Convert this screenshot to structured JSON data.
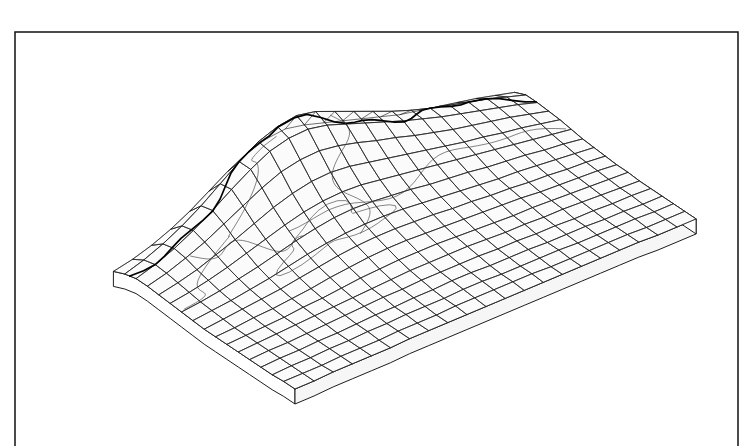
{
  "figure": {
    "kind": "wireframe-surface-block",
    "background_color": "#ffffff",
    "line_color": "#1a1a1a",
    "facet_fill_color": "#fbfbfb",
    "overlay_color": "#3a3a3a",
    "ridge_color": "#000000",
    "frame_color": "#111111"
  },
  "frame": {
    "name": "plot-border",
    "left": 15,
    "top": 32,
    "right": 738,
    "bottom": 446,
    "sides_drawn": "left, top, right",
    "stroke_width": 1.5
  },
  "chart_data": {
    "type": "surface",
    "subtitle": "",
    "xlabel": "",
    "ylabel": "",
    "zlabel": "",
    "grid": true,
    "legend": "none",
    "grid_columns": 22,
    "grid_rows": 17,
    "projection": {
      "kind": "oblique-parallel",
      "origin_x": 295,
      "origin_y": 395,
      "u_dx": 19.1,
      "u_dy": -8.05,
      "v_dx": -11.35,
      "v_dy": -6.6,
      "z_scale": -1.0
    },
    "base_slab": {
      "thickness_px": 15,
      "front_left_vertex": [
        45,
        288
      ],
      "bottom_vertex": [
        295,
        396
      ],
      "right_vertex": [
        716,
        219
      ],
      "back_vertex": [
        462,
        113
      ]
    },
    "elevation_range": [
      0,
      108
    ],
    "elevation_units": "relative",
    "peak": {
      "grid_col": 9,
      "grid_row": 1,
      "value": 108,
      "screen": [
        357,
        22
      ]
    },
    "elevation_grid": [
      [
        18,
        22,
        28,
        36,
        46,
        58,
        70,
        80,
        86,
        88,
        84,
        78,
        72,
        66,
        60,
        54,
        50,
        46,
        42,
        38,
        33,
        28
      ],
      [
        22,
        28,
        36,
        46,
        58,
        72,
        86,
        98,
        105,
        108,
        104,
        96,
        88,
        80,
        72,
        65,
        59,
        54,
        49,
        44,
        38,
        32
      ],
      [
        24,
        30,
        38,
        48,
        60,
        73,
        85,
        95,
        100,
        101,
        97,
        90,
        83,
        76,
        69,
        63,
        57,
        52,
        47,
        42,
        37,
        31
      ],
      [
        23,
        28,
        35,
        43,
        53,
        63,
        73,
        81,
        85,
        86,
        83,
        78,
        72,
        67,
        61,
        56,
        51,
        47,
        43,
        39,
        34,
        29
      ],
      [
        21,
        25,
        30,
        37,
        44,
        52,
        60,
        66,
        70,
        71,
        69,
        65,
        61,
        57,
        53,
        49,
        45,
        42,
        38,
        35,
        31,
        27
      ],
      [
        19,
        22,
        26,
        31,
        37,
        43,
        49,
        54,
        57,
        58,
        57,
        54,
        51,
        48,
        45,
        42,
        39,
        36,
        33,
        30,
        27,
        24
      ],
      [
        17,
        19,
        22,
        26,
        30,
        35,
        40,
        44,
        47,
        48,
        47,
        45,
        43,
        40,
        38,
        36,
        33,
        31,
        29,
        26,
        24,
        21
      ],
      [
        15,
        17,
        19,
        22,
        25,
        29,
        33,
        36,
        38,
        39,
        39,
        38,
        36,
        34,
        32,
        30,
        28,
        27,
        25,
        23,
        21,
        19
      ],
      [
        13,
        15,
        17,
        19,
        21,
        24,
        27,
        30,
        32,
        33,
        33,
        32,
        31,
        29,
        28,
        26,
        25,
        23,
        22,
        20,
        19,
        17
      ],
      [
        12,
        13,
        15,
        16,
        18,
        20,
        23,
        25,
        27,
        28,
        28,
        27,
        26,
        25,
        24,
        23,
        22,
        20,
        19,
        18,
        17,
        15
      ],
      [
        11,
        12,
        13,
        14,
        16,
        17,
        19,
        21,
        22,
        23,
        23,
        23,
        22,
        21,
        20,
        19,
        19,
        18,
        17,
        16,
        15,
        14
      ],
      [
        10,
        11,
        12,
        13,
        14,
        15,
        16,
        17,
        18,
        19,
        19,
        19,
        19,
        18,
        17,
        17,
        16,
        16,
        15,
        14,
        13,
        12
      ],
      [
        9,
        10,
        10,
        11,
        12,
        13,
        14,
        15,
        15,
        16,
        16,
        16,
        16,
        15,
        15,
        14,
        14,
        13,
        13,
        12,
        12,
        11
      ],
      [
        8,
        9,
        9,
        10,
        10,
        11,
        12,
        12,
        13,
        13,
        14,
        14,
        13,
        13,
        13,
        12,
        12,
        12,
        11,
        11,
        10,
        10
      ],
      [
        7,
        8,
        8,
        9,
        9,
        10,
        10,
        11,
        11,
        11,
        12,
        12,
        11,
        11,
        11,
        11,
        10,
        10,
        10,
        10,
        9,
        9
      ],
      [
        7,
        7,
        7,
        8,
        8,
        8,
        9,
        9,
        9,
        10,
        10,
        10,
        10,
        10,
        9,
        9,
        9,
        9,
        9,
        8,
        8,
        8
      ],
      [
        6,
        6,
        7,
        7,
        7,
        7,
        8,
        8,
        8,
        8,
        8,
        8,
        8,
        8,
        8,
        8,
        8,
        8,
        8,
        7,
        7,
        7
      ]
    ],
    "overlays": [
      {
        "name": "mountain-ridge-crest",
        "style": "heavy-black",
        "description": "dark crest line running across the upper slope"
      },
      {
        "name": "coastline-west",
        "style": "thin-dark",
        "description": "irregular boundary descending the left flank"
      },
      {
        "name": "lake-outline",
        "style": "thin-gray",
        "description": "closed loop in mid-field"
      },
      {
        "name": "river-course",
        "style": "thin-gray",
        "description": "sinuous line from crest to mid-field"
      },
      {
        "name": "administrative-boundary",
        "style": "thin-gray",
        "description": "long polyline across the right slope"
      }
    ]
  },
  "annotations": {
    "axis_ticks_visible": false,
    "labels_visible": false,
    "legend_visible": false,
    "colorbar_visible": false
  }
}
